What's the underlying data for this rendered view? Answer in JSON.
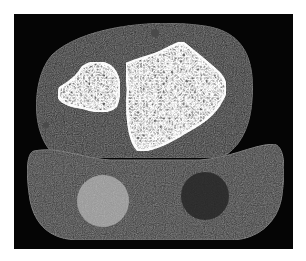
{
  "image": {
    "description": "Axial CT cross-section of a limb (wrist/ankle) with two trabecular bones inside soft tissue, resting on a positioning pad containing a bright circular calibration phantom and a darker circular region",
    "colors": {
      "background": "#ffffff",
      "frame": "#050505",
      "soft_tissue": "#2a2a2a",
      "pad": "#3a3a3a",
      "bone_cortex": "#e8e8e8",
      "bone_marrow": "#6a6a6a",
      "phantom_bright": "#9a9a9a",
      "phantom_dark": "#262626"
    }
  }
}
